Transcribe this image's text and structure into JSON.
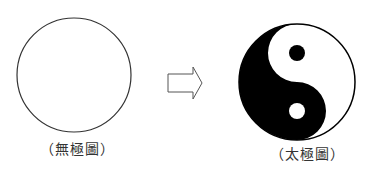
{
  "diagram": {
    "left": {
      "name": "wuji-circle",
      "label": "（無極圖）",
      "shape": "empty circle",
      "stroke_color": "#333333"
    },
    "arrow": {
      "name": "transition-arrow",
      "direction": "right",
      "stroke_color": "#555555"
    },
    "right": {
      "name": "taiji-symbol",
      "label": "（太極圖）",
      "shape": "yin-yang",
      "dark_color": "#000000",
      "light_color": "#ffffff"
    }
  }
}
